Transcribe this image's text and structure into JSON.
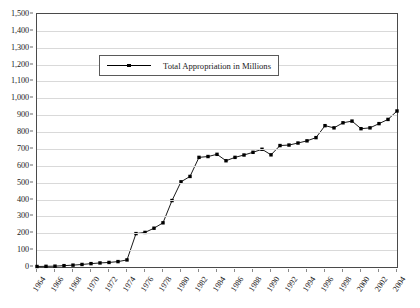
{
  "chart_data": {
    "type": "line",
    "title": "",
    "xlabel": "",
    "ylabel": "",
    "ylim": [
      0,
      1500
    ],
    "ytick_step": 100,
    "yticks": [
      "0",
      "100",
      "200",
      "300",
      "400",
      "500",
      "600",
      "700",
      "800",
      "900",
      "1,000",
      "1,100",
      "1,200",
      "1,300",
      "1,400",
      "1,500"
    ],
    "grid": true,
    "legend_position": "inside-top-center",
    "legend": [
      "Total Appropriation in Millions"
    ],
    "xlim": [
      1964,
      2004
    ],
    "xtick_step": 2,
    "xticks": [
      "1964",
      "1966",
      "1968",
      "1970",
      "1972",
      "1974",
      "1976",
      "1978",
      "1980",
      "1982",
      "1984",
      "1986",
      "1988",
      "1990",
      "1992",
      "1994",
      "1996",
      "1998",
      "2000",
      "2002",
      "2004"
    ],
    "x": [
      1964,
      1965,
      1966,
      1967,
      1968,
      1969,
      1970,
      1971,
      1972,
      1973,
      1974,
      1975,
      1976,
      1977,
      1978,
      1979,
      1980,
      1981,
      1982,
      1983,
      1984,
      1985,
      1986,
      1987,
      1988,
      1989,
      1990,
      1991,
      1992,
      1993,
      1994,
      1995,
      1996,
      1997,
      1998,
      1999,
      2000,
      2001,
      2002,
      2003,
      2004
    ],
    "series": [
      {
        "name": "Total Appropriation in Millions",
        "color": "#000000",
        "marker": "square",
        "values": [
          3,
          4,
          5,
          8,
          11,
          15,
          20,
          24,
          27,
          32,
          42,
          198,
          205,
          230,
          262,
          394,
          505,
          537,
          650,
          655,
          668,
          630,
          650,
          664,
          680,
          698,
          665,
          720,
          723,
          735,
          748,
          767,
          838,
          825,
          855,
          865,
          820,
          825,
          850,
          875,
          925
        ]
      }
    ]
  },
  "legend": {
    "label": "Total Appropriation in Millions"
  }
}
